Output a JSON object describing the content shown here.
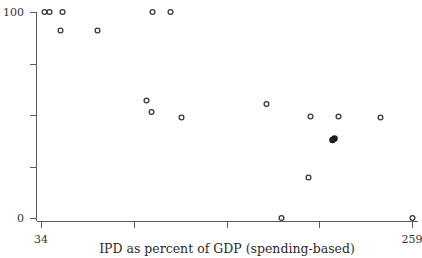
{
  "chart_data": {
    "type": "scatter",
    "title": "",
    "xlabel": "IPD as percent of GDP (spending-based)",
    "ylabel": "",
    "xlim": [
      34,
      259
    ],
    "ylim": [
      0,
      100
    ],
    "grid": false,
    "legend": "none",
    "x_tick_labels": [
      "34",
      "259"
    ],
    "y_tick_labels": [
      "100",
      "0"
    ],
    "x_tick_values": [
      34,
      259
    ],
    "y_tick_values": [
      100,
      0
    ],
    "x_tick_count": 5,
    "y_tick_count": 5,
    "marker": "open-circle",
    "points": [
      {
        "x": 35,
        "y": 100
      },
      {
        "x": 41,
        "y": 100
      },
      {
        "x": 57,
        "y": 100
      },
      {
        "x": 196,
        "y": 100
      },
      {
        "x": 218,
        "y": 100
      },
      {
        "x": 55,
        "y": 91
      },
      {
        "x": 100,
        "y": 91
      },
      {
        "x": 162,
        "y": 57
      },
      {
        "x": 168,
        "y": 52
      },
      {
        "x": 205,
        "y": 49
      },
      {
        "x": 309,
        "y": 55
      },
      {
        "x": 362,
        "y": 49
      },
      {
        "x": 396,
        "y": 49
      },
      {
        "x": 447,
        "y": 49
      },
      {
        "x": 392,
        "y": 39
      },
      {
        "x": 391,
        "y": 38
      },
      {
        "x": 359,
        "y": 20
      },
      {
        "x": 327,
        "y": 0
      },
      {
        "x": 485,
        "y": 0
      }
    ],
    "points_px": [
      {
        "px": 44.5,
        "py": 12.0,
        "filled": false
      },
      {
        "px": 49.5,
        "py": 12.0,
        "filled": false
      },
      {
        "px": 62.5,
        "py": 12.0,
        "filled": false
      },
      {
        "px": 152.5,
        "py": 12.0,
        "filled": false
      },
      {
        "px": 170.5,
        "py": 12.0,
        "filled": false
      },
      {
        "px": 60.5,
        "py": 30.5,
        "filled": false
      },
      {
        "px": 97.5,
        "py": 30.5,
        "filled": false
      },
      {
        "px": 146.5,
        "py": 100.5,
        "filled": false
      },
      {
        "px": 151.5,
        "py": 112.0,
        "filled": false
      },
      {
        "px": 181.5,
        "py": 117.5,
        "filled": false
      },
      {
        "px": 266.5,
        "py": 104.0,
        "filled": false
      },
      {
        "px": 310.5,
        "py": 116.5,
        "filled": false
      },
      {
        "px": 338.5,
        "py": 116.5,
        "filled": false
      },
      {
        "px": 380.5,
        "py": 117.5,
        "filled": false
      },
      {
        "px": 334.5,
        "py": 138.5,
        "filled": true
      },
      {
        "px": 332.5,
        "py": 140.0,
        "filled": true
      },
      {
        "px": 308.5,
        "py": 177.5,
        "filled": false
      },
      {
        "px": 281.5,
        "py": 218.0,
        "filled": false
      },
      {
        "px": 412.5,
        "py": 218.0,
        "filled": false
      }
    ],
    "axes_px": {
      "x0": 41,
      "x1": 412,
      "y_top": 12,
      "y_bottom": 218,
      "x_ticks": [
        41,
        134,
        227,
        319,
        412
      ],
      "y_ticks": [
        12,
        64,
        115,
        167,
        218
      ]
    }
  }
}
